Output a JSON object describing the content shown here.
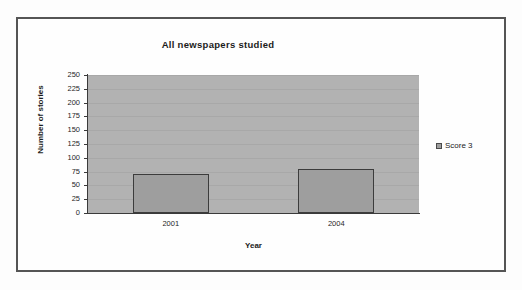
{
  "chart_data": {
    "type": "bar",
    "title": "All newspapers studied",
    "xlabel": "Year",
    "ylabel": "Number of stories",
    "categories": [
      "2001",
      "2004"
    ],
    "series": [
      {
        "name": "Score 3",
        "values": [
          70,
          80
        ]
      }
    ],
    "ylim": [
      0,
      250
    ],
    "yticks": [
      0,
      25,
      50,
      75,
      100,
      125,
      150,
      175,
      200,
      225,
      250
    ],
    "ytick_labels": [
      "0",
      "25",
      "50",
      "75",
      "100",
      "125",
      "150",
      "175",
      "200",
      "225",
      "250"
    ],
    "grid": true,
    "legend_position": "right",
    "legend_entries": [
      "Score 3"
    ],
    "colors": {
      "bar_fill": "#9e9e9e",
      "bar_border": "#3c3c3c",
      "plot_background": "#b2b2b2",
      "gridline": "#a8a8a8",
      "axis": "#3a3a3a",
      "text": "#1b1b1b",
      "frame_border": "#555555",
      "page_background": "#fdfdfd"
    }
  }
}
